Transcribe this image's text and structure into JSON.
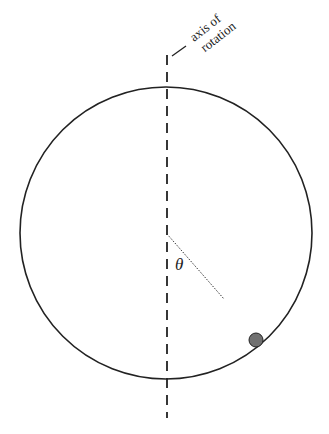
{
  "diagram": {
    "axis_label_line1": "axis of",
    "axis_label_line2": "rotation",
    "angle_symbol": "θ",
    "colors": {
      "line": "#222222",
      "ball": "#707070",
      "background": "#ffffff"
    },
    "elements": {
      "circle": {
        "cx": 166,
        "cy": 233,
        "r": 147
      },
      "axis": {
        "x": 167,
        "y1": 55,
        "y2": 418
      },
      "ball": {
        "cx": 256,
        "cy": 340,
        "r": 7
      }
    }
  }
}
